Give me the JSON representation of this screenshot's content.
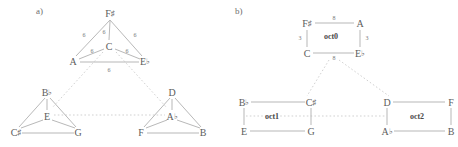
{
  "figure": {
    "panels": [
      {
        "id": "a",
        "label": "a)",
        "label_pos": {
          "x": 36,
          "y": 6
        },
        "type": "augmented-triad-graph",
        "clusters": [
          {
            "name": "top-triangle",
            "nodes": [
              {
                "name": "node-f-sharp",
                "letter": "F",
                "accidental": "♯",
                "x": 110,
                "y": 13
              },
              {
                "name": "node-a",
                "letter": "A",
                "accidental": "",
                "x": 73,
                "y": 61
              },
              {
                "name": "node-e-flat",
                "letter": "E",
                "accidental": "♭",
                "x": 145,
                "y": 61
              },
              {
                "name": "node-c",
                "letter": "C",
                "accidental": "",
                "x": 109,
                "y": 46
              }
            ],
            "edges": [
              {
                "from": "F♯",
                "to": "A",
                "weight": "6",
                "lx": 84,
                "ly": 35
              },
              {
                "from": "F♯",
                "to": "E♭",
                "weight": "6",
                "lx": 135,
                "ly": 35
              },
              {
                "from": "A",
                "to": "E♭",
                "weight": "6",
                "lx": 109,
                "ly": 70
              },
              {
                "from": "F♯",
                "to": "C",
                "weight": "6",
                "lx": 106,
                "ly": 32
              },
              {
                "from": "C",
                "to": "A",
                "weight": "6",
                "lx": 92,
                "ly": 51
              },
              {
                "from": "C",
                "to": "E♭",
                "weight": "6",
                "lx": 127,
                "ly": 51
              }
            ]
          },
          {
            "name": "bottom-left-triangle",
            "nodes": [
              {
                "name": "node-b-flat",
                "letter": "B",
                "accidental": "♭",
                "x": 47,
                "y": 92
              },
              {
                "name": "node-c-sharp",
                "letter": "C",
                "accidental": "♯",
                "x": 16,
                "y": 132
              },
              {
                "name": "node-g",
                "letter": "G",
                "accidental": "",
                "x": 78,
                "y": 132
              },
              {
                "name": "node-e",
                "letter": "E",
                "accidental": "",
                "x": 47,
                "y": 116
              }
            ]
          },
          {
            "name": "bottom-right-triangle",
            "nodes": [
              {
                "name": "node-d",
                "letter": "D",
                "accidental": "",
                "x": 172,
                "y": 92
              },
              {
                "name": "node-f",
                "letter": "F",
                "accidental": "",
                "x": 141,
                "y": 132
              },
              {
                "name": "node-b",
                "letter": "B",
                "accidental": "",
                "x": 203,
                "y": 132
              },
              {
                "name": "node-a-flat",
                "letter": "A",
                "accidental": "♭",
                "x": 172,
                "y": 116
              }
            ]
          }
        ]
      },
      {
        "id": "b",
        "label": "b)",
        "label_pos": {
          "x": 6,
          "y": 6
        },
        "type": "octatonic-square-graph",
        "clusters": [
          {
            "name": "oct0",
            "set_label": "oct0",
            "set_label_pos": {
              "x": 102,
              "y": 36
            },
            "nodes": [
              {
                "name": "node-f-sharp",
                "letter": "F",
                "accidental": "♯",
                "x": 78,
                "y": 23
              },
              {
                "name": "node-a",
                "letter": "A",
                "accidental": "",
                "x": 131,
                "y": 23
              },
              {
                "name": "node-c",
                "letter": "C",
                "accidental": "",
                "x": 78,
                "y": 53
              },
              {
                "name": "node-e-flat",
                "letter": "E",
                "accidental": "♭",
                "x": 131,
                "y": 53
              }
            ],
            "edges": [
              {
                "from": "F♯",
                "to": "A",
                "weight": "8",
                "lx": 105,
                "ly": 18
              },
              {
                "from": "C",
                "to": "E♭",
                "weight": "8",
                "lx": 105,
                "ly": 58
              },
              {
                "from": "F♯",
                "to": "C",
                "weight": "3",
                "lx": 71,
                "ly": 38
              },
              {
                "from": "A",
                "to": "E♭",
                "weight": "3",
                "lx": 138,
                "ly": 38
              }
            ]
          },
          {
            "name": "oct1",
            "set_label": "oct1",
            "set_label_pos": {
              "x": 43,
              "y": 116
            },
            "nodes": [
              {
                "name": "node-b-flat",
                "letter": "B",
                "accidental": "♭",
                "x": 15,
                "y": 102
              },
              {
                "name": "node-c-sharp",
                "letter": "C",
                "accidental": "♯",
                "x": 82,
                "y": 102
              },
              {
                "name": "node-e",
                "letter": "E",
                "accidental": "",
                "x": 15,
                "y": 131
              },
              {
                "name": "node-g",
                "letter": "G",
                "accidental": "",
                "x": 82,
                "y": 131
              }
            ]
          },
          {
            "name": "oct2",
            "set_label": "oct2",
            "set_label_pos": {
              "x": 188,
              "y": 116
            },
            "nodes": [
              {
                "name": "node-d",
                "letter": "D",
                "accidental": "",
                "x": 158,
                "y": 102
              },
              {
                "name": "node-f",
                "letter": "F",
                "accidental": "",
                "x": 222,
                "y": 102
              },
              {
                "name": "node-a-flat",
                "letter": "A",
                "accidental": "♭",
                "x": 158,
                "y": 131
              },
              {
                "name": "node-b",
                "letter": "B",
                "accidental": "",
                "x": 222,
                "y": 131
              }
            ]
          }
        ]
      }
    ],
    "colors": {
      "solid_edge": "#9a9a9a",
      "dashed_edge": "#b9b9b9",
      "text": "#5d5d5d",
      "background": "#ffffff"
    }
  }
}
